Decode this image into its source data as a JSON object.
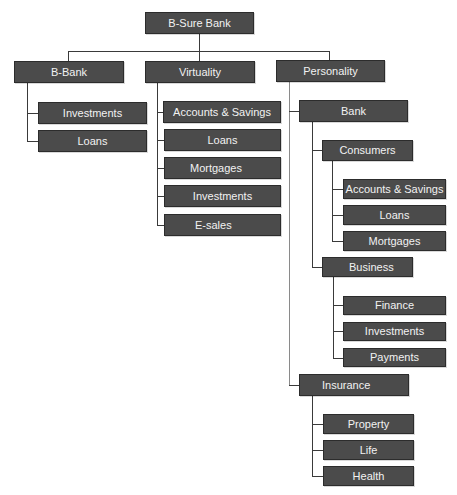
{
  "diagram": {
    "type": "org-chart",
    "colors": {
      "node_fill": "#4b4b4b",
      "node_border": "#2c2c2c",
      "node_text": "#f2f2f2",
      "connector": "#3a3a3a",
      "background": "#ffffff"
    },
    "root": {
      "label": "B-Sure Bank"
    },
    "level1": [
      {
        "label": "B-Bank",
        "children": [
          {
            "label": "Investments"
          },
          {
            "label": "Loans"
          }
        ]
      },
      {
        "label": "Virtuality",
        "children": [
          {
            "label": "Accounts & Savings"
          },
          {
            "label": "Loans"
          },
          {
            "label": "Mortgages"
          },
          {
            "label": "Investments"
          },
          {
            "label": "E-sales"
          }
        ]
      },
      {
        "label": "Personality",
        "children": [
          {
            "label": "Bank",
            "children": [
              {
                "label": "Consumers",
                "children": [
                  {
                    "label": "Accounts & Savings"
                  },
                  {
                    "label": "Loans"
                  },
                  {
                    "label": "Mortgages"
                  }
                ]
              },
              {
                "label": "Business",
                "children": [
                  {
                    "label": "Finance"
                  },
                  {
                    "label": "Investments"
                  },
                  {
                    "label": "Payments"
                  }
                ]
              }
            ]
          },
          {
            "label": "Insurance",
            "children": [
              {
                "label": "Property"
              },
              {
                "label": "Life"
              },
              {
                "label": "Health"
              }
            ]
          }
        ]
      }
    ]
  }
}
